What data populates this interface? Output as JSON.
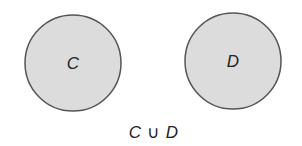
{
  "diagram": {
    "type": "venn-disjoint",
    "sets": [
      {
        "label": "C",
        "fill": "#dcdcdc",
        "stroke": "#555555"
      },
      {
        "label": "D",
        "fill": "#dcdcdc",
        "stroke": "#555555"
      }
    ],
    "caption": {
      "left": "C",
      "operator": "∪",
      "right": "D"
    }
  }
}
